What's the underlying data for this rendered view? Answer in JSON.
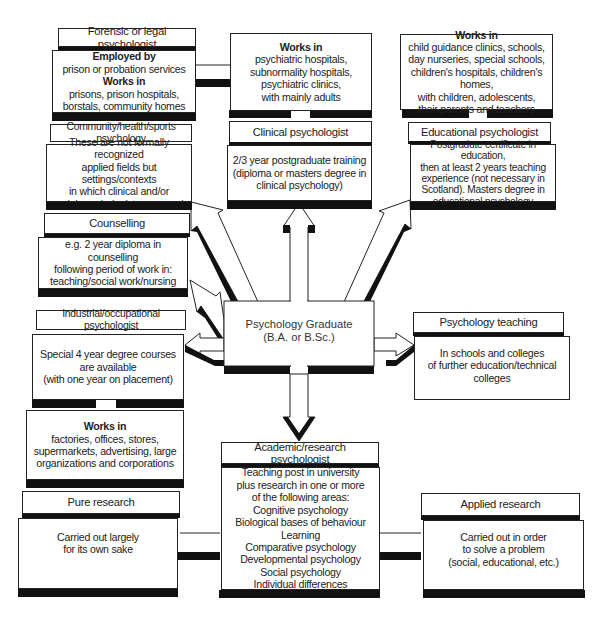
{
  "diagram": {
    "center": {
      "title": "Psychology Graduate",
      "subtitle": "(B.A. or B.Sc.)"
    },
    "forensic": {
      "title": "Forensic or legal psychologist",
      "employed_label": "Employed by",
      "employed_text": "prison or probation services",
      "works_label": "Works in",
      "works_line1": "prisons, prison hospitals,",
      "works_line2": "borstals, community homes"
    },
    "community": {
      "title": "Community/health/sports psychology",
      "line1": "These are not formally recognized",
      "line2": "applied fields but settings/contexts",
      "line3": "in which clinical and/or",
      "line4": "social psychologists may work"
    },
    "counselling": {
      "title": "Counselling",
      "line1": "e.g. 2 year diploma in counselling",
      "line2": "following period of work in:",
      "line3": "teaching/social work/nursing"
    },
    "industrial": {
      "title": "Industrial/occupational psychologist",
      "line1": "Special 4 year degree courses",
      "line2": "are available",
      "line3": "(with one year on placement)",
      "works_label": "Works in",
      "works_line1": "factories, offices, stores,",
      "works_line2": "supermarkets, advertising, large",
      "works_line3": "organizations and corporations"
    },
    "clinical": {
      "title": "Clinical psychologist",
      "works_label": "Works in",
      "works_line1": "psychiatric hospitals,",
      "works_line2": "subnormality hospitals,",
      "works_line3": "psychiatric clinics,",
      "works_line4": "with mainly adults",
      "line1": "2/3 year postgraduate training",
      "line2": "(diploma or masters degree in",
      "line3": "clinical psychology)"
    },
    "educational": {
      "title": "Educational psychologist",
      "works_label": "Works in",
      "works_line1": "child guidance clinics, schools,",
      "works_line2": "day nurseries, special schools,",
      "works_line3": "children's hospitals, children's homes,",
      "works_line4": "with children, adolescents,",
      "works_line5": "their parents and teachers",
      "line1": "Postgradute certificate in education,",
      "line2": "then at least 2 years teaching",
      "line3": "experience (not necessary in",
      "line4": "Scotland). Masters degree in",
      "line5": "educational psychology"
    },
    "teaching": {
      "title": "Psychology teaching",
      "line1": "In schools and colleges",
      "line2": "of further education/technical",
      "line3": "colleges"
    },
    "academic": {
      "title": "Academic/research psychologist",
      "line1": "Teaching post in university",
      "line2": "plus research in one or more",
      "line3": "of the following areas:",
      "areas": [
        "Cognitive psychology",
        "Biological bases of behaviour",
        "Learning",
        "Comparative psychology",
        "Developmental psychology",
        "Social psychology",
        "Individual differences"
      ]
    },
    "pure_research": {
      "title": "Pure research",
      "line1": "Carried out largely",
      "line2": "for its own sake"
    },
    "applied_research": {
      "title": "Applied research",
      "line1": "Carried out in order",
      "line2": "to solve a problem",
      "line3": "(social, educational, etc.)"
    }
  },
  "colors": {
    "outline": "#222222",
    "shadow": "#111111",
    "background": "#ffffff"
  }
}
